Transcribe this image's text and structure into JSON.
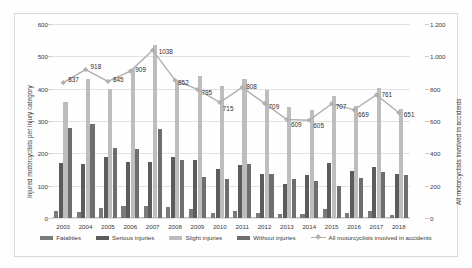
{
  "chart_data": {
    "type": "bar",
    "title": "",
    "xlabel": "",
    "ylabel": "Injured motorcyclists per injury category",
    "y2label": "All motorcyclists involved in accidents",
    "ylim": [
      0,
      600
    ],
    "y2lim": [
      0,
      1200
    ],
    "yticks": [
      "0",
      "100",
      "200",
      "300",
      "400",
      "500",
      "600"
    ],
    "y2ticks": [
      "0",
      "200",
      "400",
      "600",
      "800",
      "1.000",
      "1.200"
    ],
    "grid": true,
    "legend_position": "bottom",
    "categories": [
      "2003",
      "2004",
      "2005",
      "2006",
      "2007",
      "2008",
      "2009",
      "2010",
      "2011",
      "2012",
      "2013",
      "2014",
      "2015",
      "2016",
      "2017",
      "2018"
    ],
    "series": [
      {
        "name": "Fatalities",
        "color": "#7a7a7a",
        "axis": "left",
        "values": [
          23,
          19,
          30,
          38,
          36,
          33,
          28,
          15,
          23,
          14,
          13,
          12,
          29,
          16,
          21,
          10
        ]
      },
      {
        "name": "Serious injuries",
        "color": "#5c5c5c",
        "axis": "left",
        "values": [
          171,
          167,
          189,
          172,
          174,
          190,
          179,
          152,
          165,
          136,
          104,
          134,
          170,
          144,
          159,
          136
        ]
      },
      {
        "name": "Slight injuries",
        "color": "#bdbdbd",
        "axis": "left",
        "values": [
          359,
          431,
          400,
          461,
          534,
          421,
          438,
          407,
          430,
          395,
          343,
          333,
          378,
          347,
          403,
          336
        ]
      },
      {
        "name": "Without injuries",
        "color": "#6e6e6e",
        "axis": "left",
        "values": [
          277,
          292,
          216,
          214,
          274,
          180,
          128,
          121,
          166,
          136,
          120,
          115,
          100,
          125,
          143,
          132
        ]
      },
      {
        "name": "All motorcyclists involved in accidents",
        "color": "#b0b0b0",
        "axis": "right",
        "values": [
          837,
          918,
          845,
          909,
          1038,
          852,
          795,
          715,
          808,
          709,
          609,
          605,
          707,
          669,
          761,
          651
        ],
        "labels": [
          "837",
          "918",
          "845",
          "909",
          "1038",
          "852",
          "795",
          "715",
          "808",
          "709",
          "609",
          "605",
          "707",
          "669",
          "761",
          "651"
        ]
      }
    ]
  },
  "legend": {
    "items": [
      {
        "label": "Fatalities",
        "type": "bar",
        "color": "#7a7a7a"
      },
      {
        "label": "Serious injuries",
        "type": "bar",
        "color": "#5c5c5c"
      },
      {
        "label": "Slight injuries",
        "type": "bar",
        "color": "#bdbdbd"
      },
      {
        "label": "Without injuries",
        "type": "bar",
        "color": "#6e6e6e"
      },
      {
        "label": "All motorcyclists involved in accidents",
        "type": "line",
        "color": "#b0b0b0"
      }
    ]
  }
}
